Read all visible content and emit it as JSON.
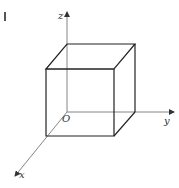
{
  "diagram": {
    "type": "3d-cube-on-axes",
    "labels": {
      "origin": "O",
      "x_axis": "x",
      "y_axis": "y",
      "z_axis": "z"
    },
    "colors": {
      "background": "#ffffff",
      "edge": "#222222",
      "axis": "#777777"
    }
  }
}
